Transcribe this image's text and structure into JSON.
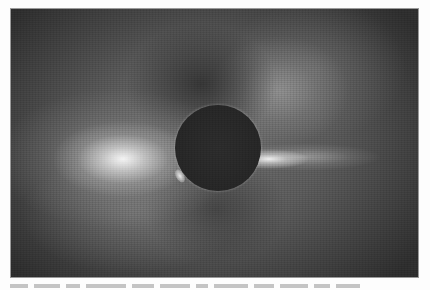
{
  "image": {
    "subject": "Total solar eclipse corona",
    "color_mode": "grayscale",
    "elements": {
      "disk": "dark lunar disk centered in frame",
      "left_streamer": "broad bright coronal streamer to the left",
      "right_ray": "narrow bright coronal ray to the right",
      "upper_plume": "faint diffuse plume toward upper right"
    },
    "colors": {
      "background_dark": "#2e2e2e",
      "corona_mid": "#6e6e6e",
      "streamer_bright": "#f5f5f5",
      "disk": "#262626",
      "page": "#fdfdfd"
    }
  },
  "caption": {
    "visible": "cropped, illegible",
    "mark_widths": [
      18,
      26,
      14,
      40,
      22,
      30,
      12,
      34,
      20,
      28,
      16,
      24
    ]
  }
}
